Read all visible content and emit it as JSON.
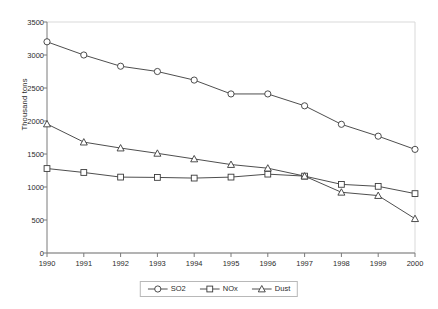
{
  "chart_data": {
    "type": "line",
    "title": "",
    "xlabel": "",
    "ylabel": "Thousand tons",
    "categories": [
      "1990",
      "1991",
      "1992",
      "1993",
      "1994",
      "1995",
      "1996",
      "1997",
      "1998",
      "1999",
      "2000"
    ],
    "xlim": [
      1990,
      2000
    ],
    "ylim": [
      0,
      3500
    ],
    "yticks": [
      0,
      500,
      1000,
      1500,
      2000,
      2500,
      3000,
      3500
    ],
    "ytick_labels": [
      "0",
      "500",
      "1000",
      "1500",
      "2000",
      "2500",
      "3000",
      "3500"
    ],
    "grid": false,
    "legend_position": "bottom-center",
    "series": [
      {
        "name": "SO2",
        "marker": "circle",
        "color": "#000000",
        "values": [
          3200,
          3000,
          2830,
          2750,
          2620,
          2410,
          2410,
          2230,
          1950,
          1770,
          1570
        ]
      },
      {
        "name": "NOx",
        "marker": "square",
        "color": "#000000",
        "values": [
          1280,
          1220,
          1150,
          1145,
          1135,
          1150,
          1195,
          1165,
          1040,
          1010,
          900
        ]
      },
      {
        "name": "Dust",
        "marker": "triangle",
        "color": "#000000",
        "values": [
          1955,
          1680,
          1590,
          1510,
          1425,
          1340,
          1285,
          1165,
          920,
          870,
          520
        ]
      }
    ]
  },
  "axis": {
    "y_title": "Thousand tons"
  },
  "legend": {
    "entries": [
      {
        "label": "SO2",
        "marker": "circle"
      },
      {
        "label": "NOx",
        "marker": "square"
      },
      {
        "label": "Dust",
        "marker": "triangle"
      }
    ]
  },
  "style": {
    "line_color": "#3a3a3a",
    "axis_color": "#7a7a7a",
    "frame_color": "#d9d9d9",
    "text_color": "#2b2b2b",
    "background": "#ffffff"
  }
}
